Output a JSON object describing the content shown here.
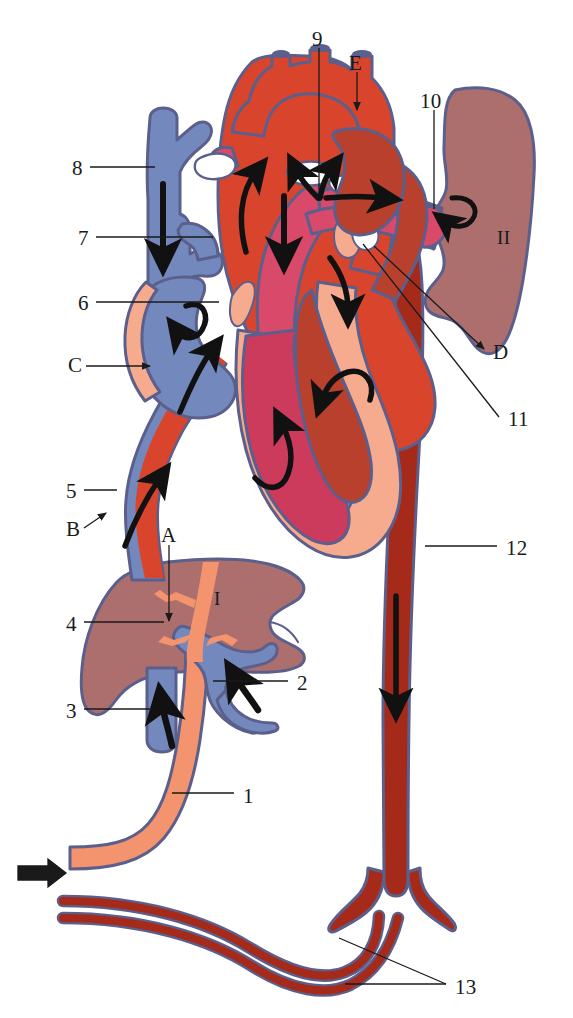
{
  "figure": {
    "background_color": "#ffffff"
  },
  "palette": {
    "oxygenated_umbilical": "#f4946e",
    "bright_arterial_red": "#d9452c",
    "mixed_pink_red": "#d94a6a",
    "dark_aorta_red": "#a52a1a",
    "venous_blue": "#7389bd",
    "pale_salmon_myocardium": "#f6ab8e",
    "organ_mauve": "#ac6f6e",
    "outline": "#5b5f8c",
    "leader_line": "#1a1a1a",
    "text": "#1a1a1a"
  },
  "numeric_labels": [
    {
      "id": "1",
      "text": "1",
      "x": 243,
      "y": 786,
      "leader": {
        "x1": 172,
        "y1": 793,
        "x2": 234,
        "y2": 793
      }
    },
    {
      "id": "2",
      "text": "2",
      "x": 297,
      "y": 673,
      "leader": {
        "x1": 213,
        "y1": 681,
        "x2": 288,
        "y2": 681
      }
    },
    {
      "id": "3",
      "text": "3",
      "x": 66,
      "y": 701,
      "leader": {
        "x1": 84,
        "y1": 709,
        "x2": 152,
        "y2": 709
      }
    },
    {
      "id": "4",
      "text": "4",
      "x": 66,
      "y": 614,
      "leader": {
        "x1": 84,
        "y1": 622,
        "x2": 164,
        "y2": 622
      }
    },
    {
      "id": "5",
      "text": "5",
      "x": 66,
      "y": 481,
      "leader": {
        "x1": 84,
        "y1": 490,
        "x2": 117,
        "y2": 490
      }
    },
    {
      "id": "6",
      "text": "6",
      "x": 78,
      "y": 293,
      "leader": {
        "x1": 96,
        "y1": 302,
        "x2": 219,
        "y2": 302
      }
    },
    {
      "id": "7",
      "text": "7",
      "x": 78,
      "y": 228,
      "leader": {
        "x1": 96,
        "y1": 237,
        "x2": 213,
        "y2": 237
      }
    },
    {
      "id": "8",
      "text": "8",
      "x": 72,
      "y": 158,
      "leader": {
        "x1": 90,
        "y1": 167,
        "x2": 155,
        "y2": 167
      }
    },
    {
      "id": "9",
      "text": "9",
      "x": 312,
      "y": 29,
      "leader": {
        "x1": 319,
        "y1": 48,
        "x2": 319,
        "y2": 190
      }
    },
    {
      "id": "10",
      "text": "10",
      "x": 420,
      "y": 91,
      "leader": {
        "x1": 434,
        "y1": 110,
        "x2": 434,
        "y2": 209
      }
    },
    {
      "id": "11",
      "text": "11",
      "x": 508,
      "y": 409,
      "leader": {
        "x1": 363,
        "y1": 244,
        "x2": 499,
        "y2": 417
      }
    },
    {
      "id": "12",
      "text": "12",
      "x": 506,
      "y": 538,
      "leader": {
        "x1": 425,
        "y1": 546,
        "x2": 497,
        "y2": 546
      }
    },
    {
      "id": "13",
      "text": "13",
      "x": 455,
      "y": 977,
      "leader": {
        "x1": 339,
        "y1": 938,
        "x2": 446,
        "y2": 984
      }
    },
    {
      "id": "13b",
      "text": "",
      "x": 0,
      "y": 0,
      "leader": {
        "x1": 345,
        "y1": 984,
        "x2": 446,
        "y2": 984
      }
    }
  ],
  "letter_labels": [
    {
      "id": "A",
      "text": "A",
      "x": 161,
      "y": 525,
      "leader": {
        "x1": 169,
        "y1": 545,
        "x2": 169,
        "y2": 621
      },
      "arrow": "down"
    },
    {
      "id": "B",
      "text": "B",
      "x": 66,
      "y": 519,
      "leader": {
        "x1": 84,
        "y1": 528,
        "x2": 106,
        "y2": 513
      },
      "arrow": "upright"
    },
    {
      "id": "C",
      "text": "C",
      "x": 68,
      "y": 355,
      "leader": {
        "x1": 86,
        "y1": 366,
        "x2": 150,
        "y2": 366
      },
      "arrow": "right"
    },
    {
      "id": "D",
      "text": "D",
      "x": 493,
      "y": 342,
      "leader": {
        "x1": 374,
        "y1": 246,
        "x2": 484,
        "y2": 349
      },
      "arrow": "upleft"
    },
    {
      "id": "E",
      "text": "E",
      "x": 349,
      "y": 53,
      "leader": {
        "x1": 357,
        "y1": 72,
        "x2": 357,
        "y2": 110
      },
      "arrow": "down"
    }
  ],
  "organ_labels": [
    {
      "id": "liver",
      "text": "I",
      "x": 214,
      "y": 589
    },
    {
      "id": "lung",
      "text": "II",
      "x": 497,
      "y": 228
    }
  ],
  "entry_arrow": {
    "id": "umbilical-vein-inflow",
    "x": 18,
    "y": 873
  }
}
